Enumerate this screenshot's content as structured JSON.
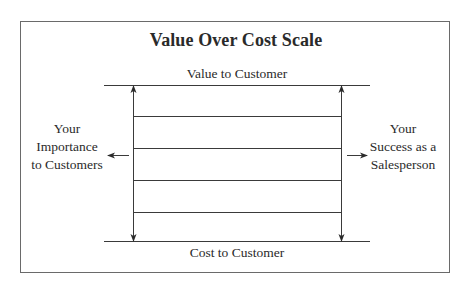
{
  "diagram": {
    "title": "Value Over Cost Scale",
    "top_label": "Value to Customer",
    "bottom_label": "Cost to Customer",
    "left_label": [
      "Your",
      "Importance",
      "to Customers"
    ],
    "right_label": [
      "Your",
      "Success as a",
      "Salesperson"
    ],
    "colors": {
      "line": "#3a3a3a",
      "text": "#2a2a2a",
      "border": "#6a6a6a",
      "background": "#ffffff"
    },
    "scale_rungs": 4
  }
}
